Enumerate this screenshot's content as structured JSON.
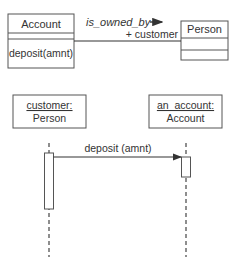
{
  "class_diagram": {
    "classes": [
      {
        "name": "Account",
        "attributes": [],
        "operations": [
          "deposit(amnt)"
        ]
      },
      {
        "name": "Person",
        "attributes": [],
        "operations": []
      }
    ],
    "association": {
      "name": "is_owned_by",
      "direction_arrow": "→",
      "role": "+ customer"
    }
  },
  "sequence_diagram": {
    "objects": [
      {
        "name": "customer:",
        "type": "Person"
      },
      {
        "name": "an_account:",
        "type": "Account"
      }
    ],
    "messages": [
      {
        "label": "deposit (amnt)",
        "from": "customer:",
        "to": "an_account:"
      }
    ]
  },
  "colors": {
    "line": "#333333",
    "box_border": "#555555",
    "background": "#ffffff"
  }
}
